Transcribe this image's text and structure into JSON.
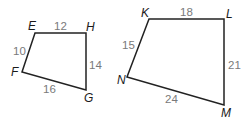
{
  "figure": {
    "type": "similar-quadrilaterals",
    "colors": {
      "edge": "#222222",
      "vertex_label": "#1a1a1a",
      "side_label": "#7a7a7a",
      "background": "#ffffff"
    },
    "quadrilaterals": [
      {
        "name": "EFGH",
        "vertices": [
          {
            "label": "E",
            "x": 35,
            "y": 33
          },
          {
            "label": "H",
            "x": 86,
            "y": 33
          },
          {
            "label": "G",
            "x": 86,
            "y": 90
          },
          {
            "label": "F",
            "x": 22,
            "y": 72
          }
        ],
        "sides": [
          {
            "between": "EH",
            "length": "12"
          },
          {
            "between": "HG",
            "length": "14"
          },
          {
            "between": "FG",
            "length": "16"
          },
          {
            "between": "EF",
            "length": "10"
          }
        ]
      },
      {
        "name": "KLMN",
        "vertices": [
          {
            "label": "K",
            "x": 149,
            "y": 19
          },
          {
            "label": "L",
            "x": 224,
            "y": 19
          },
          {
            "label": "M",
            "x": 224,
            "y": 105
          },
          {
            "label": "N",
            "x": 127,
            "y": 77
          }
        ],
        "sides": [
          {
            "between": "KL",
            "length": "18"
          },
          {
            "between": "LM",
            "length": "21"
          },
          {
            "between": "NM",
            "length": "24"
          },
          {
            "between": "KN",
            "length": "15"
          }
        ]
      }
    ]
  }
}
